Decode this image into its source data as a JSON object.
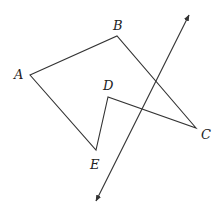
{
  "diagram": {
    "type": "polygon-with-line",
    "points": {
      "A": {
        "label": "A",
        "x": 30,
        "y": 75,
        "label_x": 14,
        "label_y": 68
      },
      "B": {
        "label": "B",
        "x": 117,
        "y": 36,
        "label_x": 113,
        "label_y": 19
      },
      "C": {
        "label": "C",
        "x": 196,
        "y": 128,
        "label_x": 201,
        "label_y": 128
      },
      "D": {
        "label": "D",
        "x": 108,
        "y": 97,
        "label_x": 103,
        "label_y": 79
      },
      "E": {
        "label": "E",
        "x": 96,
        "y": 150,
        "label_x": 90,
        "label_y": 158
      }
    },
    "polygon_order": [
      "A",
      "B",
      "C",
      "D",
      "E"
    ],
    "line": {
      "x1": 189,
      "y1": 15,
      "x2": 96,
      "y2": 201,
      "arrows": "both"
    },
    "stroke_color": "#333333"
  }
}
